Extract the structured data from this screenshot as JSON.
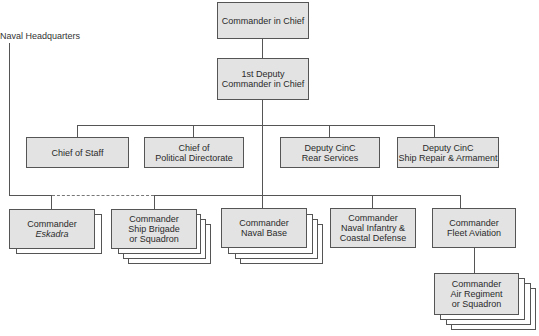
{
  "diagram": {
    "type": "org-chart",
    "side_label": "Naval Headquarters",
    "nodes": {
      "cinc": {
        "line1": "Commander in Chief"
      },
      "deputy1": {
        "line1": "1st Deputy",
        "line2": "Commander in Chief"
      },
      "chief_staff": {
        "line1": "Chief of Staff"
      },
      "chief_political": {
        "line1": "Chief of",
        "line2": "Political Directorate"
      },
      "deputy_rear": {
        "line1": "Deputy CinC",
        "line2": "Rear Services"
      },
      "deputy_repair": {
        "line1": "Deputy CinC",
        "line2": "Ship Repair & Armament"
      },
      "eskadra": {
        "line1": "Commander",
        "line2": "Eskadra"
      },
      "ship_brigade": {
        "line1": "Commander",
        "line2": "Ship Brigade",
        "line3": "or Squadron"
      },
      "naval_base": {
        "line1": "Commander",
        "line2": "Naval Base"
      },
      "naval_infantry": {
        "line1": "Commander",
        "line2": "Naval Infantry &",
        "line3": "Coastal Defense"
      },
      "fleet_aviation": {
        "line1": "Commander",
        "line2": "Fleet Aviation"
      },
      "air_regiment": {
        "line1": "Commander",
        "line2": "Air Regiment",
        "line3": "or Squadron"
      }
    },
    "edges": [
      [
        "cinc",
        "deputy1"
      ],
      [
        "deputy1",
        "chief_staff"
      ],
      [
        "deputy1",
        "chief_political"
      ],
      [
        "deputy1",
        "deputy_rear"
      ],
      [
        "deputy1",
        "deputy_repair"
      ],
      [
        "deputy1",
        "naval_base"
      ],
      [
        "deputy1",
        "naval_infantry"
      ],
      [
        "deputy1",
        "fleet_aviation"
      ],
      [
        "deputy1",
        "ship_brigade"
      ],
      [
        "naval_headquarters",
        "eskadra"
      ],
      [
        "eskadra",
        "ship_brigade",
        "dashed"
      ],
      [
        "fleet_aviation",
        "air_regiment"
      ]
    ],
    "colors": {
      "box_fill": "#e3e3e3",
      "line": "#555555"
    }
  }
}
